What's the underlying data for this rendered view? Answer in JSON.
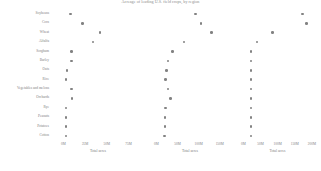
{
  "title": "Acreage of leading U.S. field crops, by region",
  "axis_title": "Total acres",
  "dot_color": "#828282",
  "text_color": "#7d7d7d",
  "categories": [
    "Soybeans",
    "Corn",
    "Wheat",
    "Alfalfa",
    "Sorghum",
    "Barley",
    "Oats",
    "Rice",
    "Vegetables and melons",
    "Orchards",
    "Rye",
    "Peanuts",
    "Potatoes",
    "Cotton"
  ],
  "chart_data": {
    "type": "scatter",
    "title": "Acreage of leading U.S. field crops, by region",
    "xlabel": "Total acres",
    "ylabel": "",
    "grid": false,
    "legend": "none",
    "categories": [
      "Soybeans",
      "Corn",
      "Wheat",
      "Alfalfa",
      "Sorghum",
      "Barley",
      "Oats",
      "Rice",
      "Vegetables and melons",
      "Orchards",
      "Rye",
      "Peanuts",
      "Potatoes",
      "Cotton"
    ],
    "panels": [
      {
        "name": "panel-1",
        "xlabel": "Total acres",
        "ticks": [
          {
            "label": "0M",
            "value": 0
          },
          {
            "label": "25M",
            "value": 25
          },
          {
            "label": "50M",
            "value": 50
          },
          {
            "label": "75M",
            "value": 75
          }
        ],
        "xlim": [
          -4,
          86
        ],
        "values": [
          8,
          22,
          42,
          34,
          9,
          9,
          4,
          3,
          9,
          10,
          3,
          3,
          3,
          3
        ]
      },
      {
        "name": "panel-2",
        "xlabel": "Total acres",
        "ticks": [
          {
            "label": "0M",
            "value": 0
          },
          {
            "label": "50M",
            "value": 50
          },
          {
            "label": "100M",
            "value": 100
          },
          {
            "label": "150M",
            "value": 150
          }
        ],
        "xlim": [
          -8,
          172
        ],
        "values": [
          92,
          106,
          130,
          65,
          38,
          28,
          24,
          22,
          28,
          34,
          22,
          20,
          20,
          19
        ]
      },
      {
        "name": "panel-3",
        "xlabel": "Total acres",
        "ticks": [
          {
            "label": "0M",
            "value": 0
          },
          {
            "label": "50M",
            "value": 50
          },
          {
            "label": "100M",
            "value": 100
          },
          {
            "label": "150M",
            "value": 150
          },
          {
            "label": "200M",
            "value": 200
          }
        ],
        "xlim": [
          -10,
          215
        ],
        "values": [
          172,
          185,
          85,
          40,
          22,
          22,
          22,
          22,
          22,
          22,
          22,
          22,
          22,
          22
        ]
      }
    ]
  }
}
